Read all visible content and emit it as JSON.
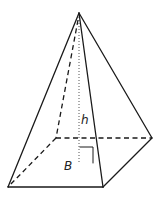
{
  "diagram": {
    "type": "square-pyramid",
    "labels": {
      "height": "h",
      "base": "B"
    },
    "colors": {
      "stroke": "#1a1a1a",
      "background": "#ffffff"
    }
  }
}
